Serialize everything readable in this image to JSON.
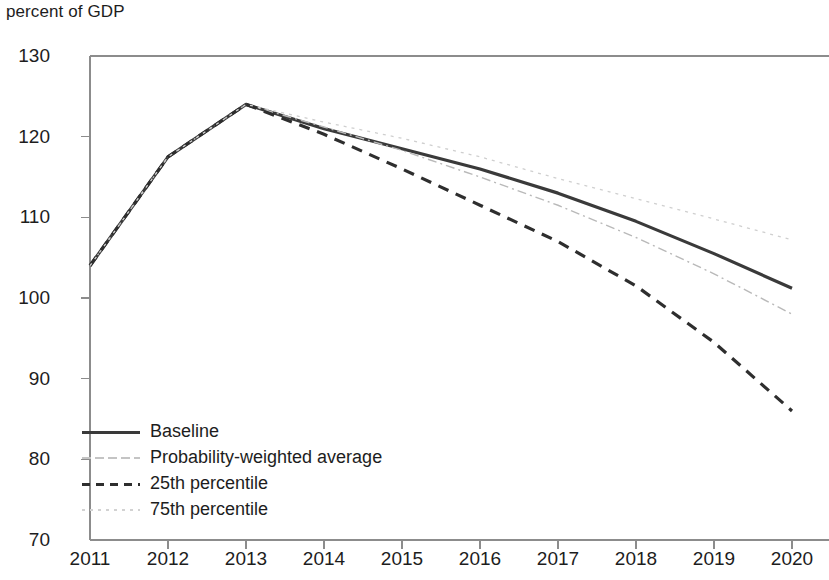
{
  "chart_data": {
    "type": "line",
    "title": "",
    "ylabel": "percent of GDP",
    "xlabel": "",
    "x": [
      2011,
      2012,
      2013,
      2014,
      2015,
      2016,
      2017,
      2018,
      2019,
      2020
    ],
    "categories": [
      "2011",
      "2012",
      "2013",
      "2014",
      "2015",
      "2016",
      "2017",
      "2018",
      "2019",
      "2020"
    ],
    "xlim": [
      2011,
      2020
    ],
    "ylim": [
      70,
      130
    ],
    "yticks": [
      70,
      80,
      90,
      100,
      110,
      120,
      130
    ],
    "ytick_labels": [
      "70",
      "80",
      "90",
      "100",
      "110",
      "120",
      "130"
    ],
    "grid": false,
    "legend_position": "lower-left",
    "series": [
      {
        "name": "Baseline",
        "style": "solid",
        "color": "#3a3a3a",
        "width": 3.2,
        "values": [
          104.0,
          117.5,
          124.0,
          121.0,
          118.5,
          116.0,
          113.0,
          109.5,
          105.5,
          101.2
        ]
      },
      {
        "name": "Probability-weighted average",
        "style": "dash-dot-fine",
        "color": "#b9b9b9",
        "width": 1.4,
        "values": [
          104.0,
          117.5,
          124.0,
          121.2,
          118.3,
          115.0,
          111.5,
          107.5,
          103.0,
          98.0
        ]
      },
      {
        "name": "25th percentile",
        "style": "dashed",
        "color": "#2e2e2e",
        "width": 3.2,
        "values": [
          104.0,
          117.5,
          124.0,
          120.3,
          116.0,
          111.5,
          107.0,
          101.5,
          94.5,
          86.0
        ]
      },
      {
        "name": "75th percentile",
        "style": "dotted-fine",
        "color": "#cfcfcf",
        "width": 1.3,
        "values": [
          104.0,
          117.5,
          124.0,
          121.8,
          119.8,
          117.5,
          114.8,
          112.3,
          109.8,
          107.2
        ]
      }
    ]
  },
  "legend": {
    "items": [
      {
        "label": "Baseline",
        "swatch": "solid-dark"
      },
      {
        "label": "Probability-weighted average",
        "swatch": "dashdot-light"
      },
      {
        "label": "25th percentile",
        "swatch": "dashed-dark"
      },
      {
        "label": "75th percentile",
        "swatch": "dotted-light"
      }
    ]
  },
  "axes": {
    "y_axis_title": "percent of GDP"
  }
}
